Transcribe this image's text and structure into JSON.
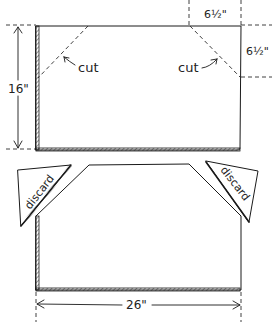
{
  "diagram": {
    "dimensions": {
      "height_label": "16\"",
      "width_label": "26\"",
      "corner_horizontal_label": "6½\"",
      "corner_vertical_label": "6½\""
    },
    "annotations": {
      "cut_left": "cut",
      "cut_right": "cut",
      "discard_left": "discard",
      "discard_right": "discard"
    },
    "colors": {
      "ink": "#1a1a1a",
      "background": "#ffffff"
    }
  }
}
